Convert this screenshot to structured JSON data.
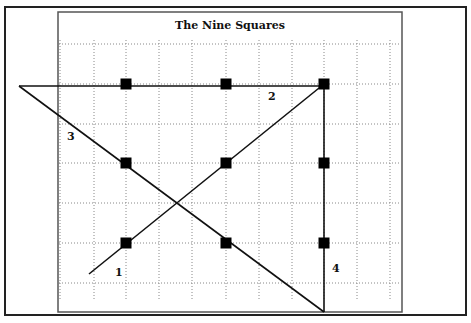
{
  "title": "The Nine Squares",
  "colors": {
    "frame": "#222222",
    "panel_border": "#555555",
    "grid": "#888888",
    "line": "#111111",
    "square": "#000000",
    "background": "#ffffff"
  },
  "outer_frame": {
    "x": 5,
    "y": 7,
    "w": 461,
    "h": 308
  },
  "panel": {
    "x": 58,
    "y": 12,
    "w": 344,
    "h": 300
  },
  "grid": {
    "vertical_x": [
      60,
      94,
      126,
      159,
      192,
      226,
      259,
      292,
      324,
      357,
      390
    ],
    "horizontal_y": [
      44,
      84,
      124,
      163,
      203,
      243,
      283
    ],
    "style": "dotted"
  },
  "squares": [
    {
      "x": 126,
      "y": 84
    },
    {
      "x": 226,
      "y": 84
    },
    {
      "x": 324,
      "y": 84
    },
    {
      "x": 126,
      "y": 163
    },
    {
      "x": 226,
      "y": 163
    },
    {
      "x": 324,
      "y": 163
    },
    {
      "x": 126,
      "y": 243
    },
    {
      "x": 226,
      "y": 243
    },
    {
      "x": 324,
      "y": 243
    }
  ],
  "square_size": 11,
  "path": {
    "points": [
      [
        89,
        274
      ],
      [
        324,
        84
      ],
      [
        324,
        312
      ],
      [
        19,
        86
      ],
      [
        324,
        86
      ]
    ],
    "segments": [
      {
        "label": "1",
        "from": [
          89,
          274
        ],
        "to": [
          324,
          84
        ],
        "label_pos": [
          115,
          276
        ]
      },
      {
        "label": "4",
        "from": [
          324,
          84
        ],
        "to": [
          324,
          312
        ],
        "label_pos": [
          332,
          272
        ]
      },
      {
        "label": "3",
        "from": [
          324,
          312
        ],
        "to": [
          19,
          86
        ],
        "label_pos": [
          67,
          140
        ]
      },
      {
        "label": "2",
        "from": [
          19,
          86
        ],
        "to": [
          324,
          86
        ],
        "label_pos": [
          268,
          100
        ]
      }
    ]
  }
}
